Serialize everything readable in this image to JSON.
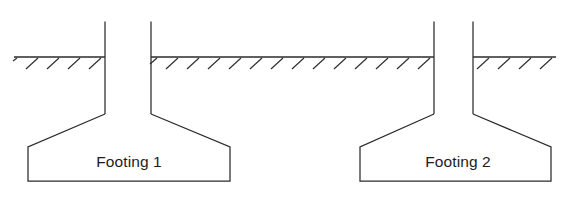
{
  "diagram": {
    "background_color": "#ffffff",
    "line_color": "#2b2b2b",
    "label_color": "#1d1d1d",
    "canvas": {
      "width": 576,
      "height": 199
    },
    "ground": {
      "label": "ground-surface",
      "y": 57,
      "hatch_direction": "down-left",
      "hatch_length": 17,
      "hatch_spacing": 21,
      "segments": [
        {
          "name": "ground-segment-left",
          "x1": 14,
          "x2": 105
        },
        {
          "name": "ground-segment-middle",
          "x1": 151,
          "x2": 434
        },
        {
          "name": "ground-segment-right",
          "x1": 473,
          "x2": 556
        }
      ]
    },
    "footings": [
      {
        "id": "footing-1",
        "label": "Footing 1",
        "label_x": 129,
        "label_y": 163,
        "column": {
          "left_x": 105,
          "right_x": 151,
          "top_y": 22,
          "bottom_y": 114
        },
        "base": {
          "left_x": 28,
          "right_x": 230,
          "shoulder_left_x": 28,
          "shoulder_right_x": 230,
          "shoulder_y": 147,
          "bottom_y": 181
        }
      },
      {
        "id": "footing-2",
        "label": "Footing 2",
        "label_x": 458,
        "label_y": 163,
        "column": {
          "left_x": 434,
          "right_x": 473,
          "top_y": 22,
          "bottom_y": 114
        },
        "base": {
          "left_x": 360,
          "right_x": 551,
          "shoulder_left_x": 360,
          "shoulder_right_x": 551,
          "shoulder_y": 147,
          "bottom_y": 181
        }
      }
    ]
  }
}
